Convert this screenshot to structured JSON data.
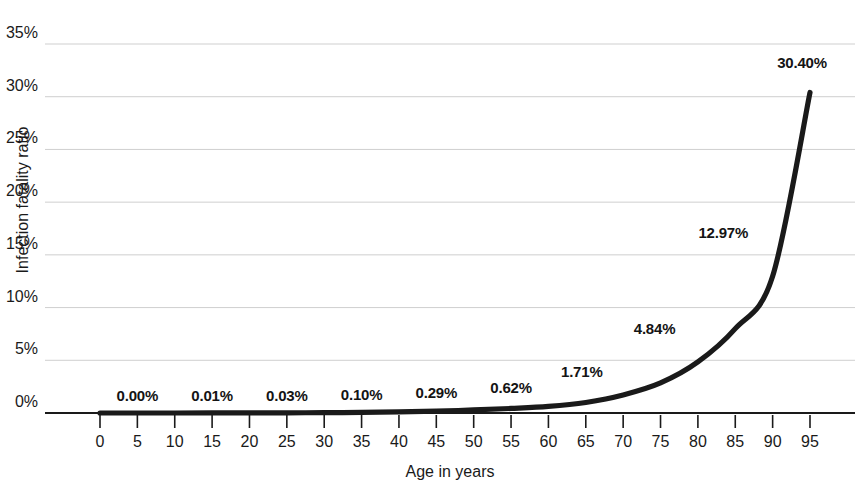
{
  "chart_data": {
    "type": "line",
    "title": "",
    "xlabel": "Age in years",
    "ylabel": "Infection fatality ratio",
    "xlim": [
      0,
      95
    ],
    "ylim": [
      0,
      35
    ],
    "grid": true,
    "legend": "none",
    "line_color": "#1a1a1a",
    "grid_color": "#cfcfcf",
    "axis_color": "#1a1a1a",
    "background": "#ffffff",
    "x_tick_labels": [
      "0",
      "5",
      "10",
      "15",
      "20",
      "25",
      "30",
      "35",
      "40",
      "45",
      "50",
      "55",
      "60",
      "65",
      "70",
      "75",
      "80",
      "85",
      "90",
      "95"
    ],
    "y_tick_labels": [
      "0%",
      "5%",
      "10%",
      "15%",
      "20%",
      "25%",
      "30%",
      "35%"
    ],
    "y_tick_values": [
      0,
      5,
      10,
      15,
      20,
      25,
      30,
      35
    ],
    "x": [
      0,
      5,
      10,
      15,
      20,
      25,
      30,
      35,
      40,
      45,
      50,
      55,
      60,
      65,
      70,
      75,
      80,
      85,
      90,
      95
    ],
    "values": [
      0.0,
      0.0,
      0.0,
      0.01,
      0.01,
      0.02,
      0.03,
      0.06,
      0.1,
      0.17,
      0.29,
      0.43,
      0.62,
      1.0,
      1.71,
      2.85,
      4.84,
      8.0,
      12.97,
      30.4
    ],
    "data_labels": [
      {
        "label": "0.00%",
        "age": 5,
        "value": 0.0
      },
      {
        "label": "0.01%",
        "age": 15,
        "value": 0.01
      },
      {
        "label": "0.03%",
        "age": 25,
        "value": 0.03
      },
      {
        "label": "0.10%",
        "age": 35,
        "value": 0.1
      },
      {
        "label": "0.29%",
        "age": 45,
        "value": 0.29
      },
      {
        "label": "0.62%",
        "age": 55,
        "value": 0.62
      },
      {
        "label": "1.71%",
        "age": 65,
        "value": 1.71
      },
      {
        "label": "4.84%",
        "age": 75,
        "value": 4.84
      },
      {
        "label": "12.97%",
        "age": 85,
        "value": 12.97
      },
      {
        "label": "30.40%",
        "age": 95,
        "value": 30.4
      }
    ]
  },
  "axes": {
    "x_title": "Age in years",
    "y_title": "Infection fatality ratio"
  },
  "y_ticks": [
    {
      "label": "35%"
    },
    {
      "label": "30%"
    },
    {
      "label": "25%"
    },
    {
      "label": "20%"
    },
    {
      "label": "15%"
    },
    {
      "label": "10%"
    },
    {
      "label": "5%"
    },
    {
      "label": "0%"
    }
  ],
  "x_ticks": [
    {
      "label": "0"
    },
    {
      "label": "5"
    },
    {
      "label": "10"
    },
    {
      "label": "15"
    },
    {
      "label": "20"
    },
    {
      "label": "25"
    },
    {
      "label": "30"
    },
    {
      "label": "35"
    },
    {
      "label": "40"
    },
    {
      "label": "45"
    },
    {
      "label": "50"
    },
    {
      "label": "55"
    },
    {
      "label": "60"
    },
    {
      "label": "65"
    },
    {
      "label": "70"
    },
    {
      "label": "75"
    },
    {
      "label": "80"
    },
    {
      "label": "85"
    },
    {
      "label": "90"
    },
    {
      "label": "95"
    }
  ],
  "point_labels": [
    {
      "label": "0.00%"
    },
    {
      "label": "0.01%"
    },
    {
      "label": "0.03%"
    },
    {
      "label": "0.10%"
    },
    {
      "label": "0.29%"
    },
    {
      "label": "0.62%"
    },
    {
      "label": "1.71%"
    },
    {
      "label": "4.84%"
    },
    {
      "label": "12.97%"
    },
    {
      "label": "30.40%"
    }
  ]
}
